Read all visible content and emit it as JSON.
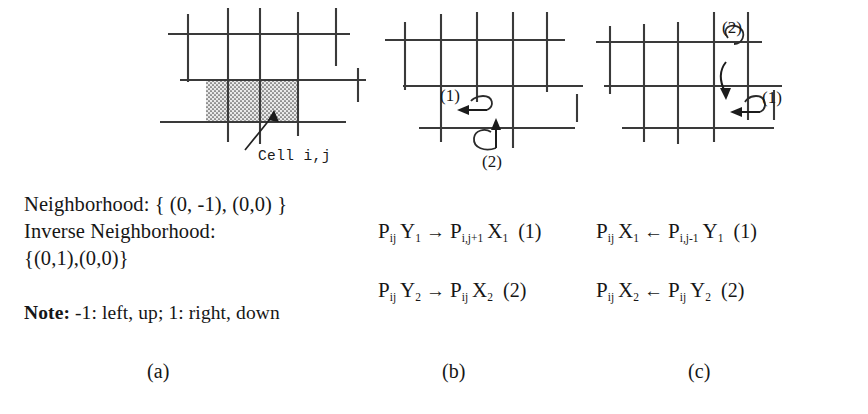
{
  "figure": {
    "caption_labels": {
      "a": "(a)",
      "b": "(b)",
      "c": "(c)"
    }
  },
  "panel_a": {
    "name": "cell-neighborhood-diagram",
    "cell_label": "Cell i,j",
    "shaded_cells": 2,
    "text": {
      "neighborhood": "Neighborhood: { (0, -1), (0,0) }",
      "inverse_neighborhood_label": "Inverse Neighborhood:",
      "inverse_neighborhood_set": "{(0,1),(0,0)}",
      "note_bold": "Note:",
      "note_rest": " -1: left, up; 1: right, down"
    }
  },
  "panel_b": {
    "name": "forward-propagation-diagram",
    "arrow_tags": [
      "(1)",
      "(2)"
    ],
    "formulas": [
      {
        "left_p": "P",
        "left_sub": "ij",
        "left_var": "Y",
        "left_var_sub": "1",
        "arrow": "→",
        "right_p": "P",
        "right_sub": "i,j+1",
        "right_var": "X",
        "right_var_sub": "1",
        "tag": "(1)"
      },
      {
        "left_p": "P",
        "left_sub": "ij",
        "left_var": "Y",
        "left_var_sub": "2",
        "arrow": "→",
        "right_p": "P",
        "right_sub": "ij",
        "right_var": "X",
        "right_var_sub": "2",
        "tag": "(2)"
      }
    ]
  },
  "panel_c": {
    "name": "inverse-propagation-diagram",
    "arrow_tags": [
      "(2)",
      "(1)"
    ],
    "formulas": [
      {
        "left_p": "P",
        "left_sub": "ij",
        "left_var": "X",
        "left_var_sub": "1",
        "arrow": "←",
        "right_p": "P",
        "right_sub": "i,j-1",
        "right_var": "Y",
        "right_var_sub": "1",
        "tag": "(1)"
      },
      {
        "left_p": "P",
        "left_sub": "ij",
        "left_var": "X",
        "left_var_sub": "2",
        "arrow": "←",
        "right_p": "P",
        "right_sub": "ij",
        "right_var": "Y",
        "right_var_sub": "2",
        "tag": "(2)"
      }
    ]
  },
  "style": {
    "ink": "#161616",
    "grid_line": "#3a3a3a",
    "shade_fill": "#e8e8e8",
    "shade_dot": "#555555",
    "background": "#ffffff"
  }
}
